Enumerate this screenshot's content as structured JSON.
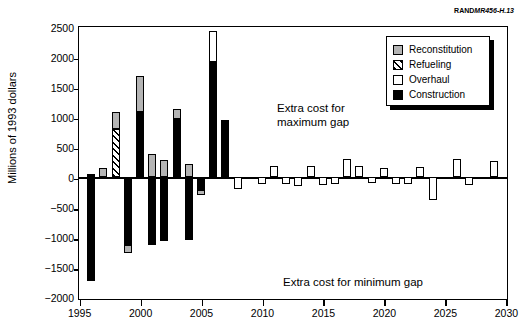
{
  "caption": {
    "rand": "RAND",
    "doc": "MR456-H.13"
  },
  "annotations": {
    "max_line1": "Extra cost for",
    "max_line2": "maximum gap",
    "min": "Extra cost for minimum gap"
  },
  "legend": {
    "items": [
      {
        "key": "reconstitution",
        "label": "Reconstitution",
        "color": "#b4b4b4"
      },
      {
        "key": "refueling",
        "label": "Refueling",
        "color": "#000000"
      },
      {
        "key": "overhaul",
        "label": "Overhaul",
        "color": "#ffffff"
      },
      {
        "key": "construction",
        "label": "Construction",
        "color": "#000000"
      }
    ]
  },
  "chart_data": {
    "type": "bar",
    "title": "",
    "subtitle": "",
    "xlabel": "",
    "ylabel": "Millions of 1993 dollars",
    "xlim": [
      1995,
      2030
    ],
    "ylim": [
      -2000,
      2500
    ],
    "ytick_labels": [
      "2500",
      "2000",
      "1500",
      "1000",
      "500",
      "0",
      "-500",
      "-1000",
      "-1500",
      "-2000"
    ],
    "yticks": [
      2500,
      2000,
      1500,
      1000,
      500,
      0,
      -500,
      -1000,
      -1500,
      -2000
    ],
    "xtick_labels": [
      "1995",
      "2000",
      "2005",
      "2010",
      "2015",
      "2020",
      "2025",
      "2030"
    ],
    "xticks": [
      1995,
      2000,
      2005,
      2010,
      2015,
      2020,
      2025,
      2030
    ],
    "grid": false,
    "legend_position": "top-right",
    "stacked": true,
    "series": [
      {
        "name": "Construction",
        "key": "construction"
      },
      {
        "name": "Refueling",
        "key": "refueling"
      },
      {
        "name": "Overhaul",
        "key": "overhaul"
      },
      {
        "name": "Reconstitution",
        "key": "reconstitution"
      }
    ],
    "x": [
      1996,
      1997,
      1998,
      1999,
      2000,
      2001,
      2002,
      2003,
      2004,
      2005,
      2006,
      2007,
      2008,
      2009,
      2010,
      2011,
      2012,
      2013,
      2014,
      2015,
      2016,
      2017,
      2018,
      2019,
      2020,
      2021,
      2022,
      2023,
      2024,
      2025,
      2026,
      2027,
      2028,
      2029,
      2030
    ],
    "bars": [
      {
        "year": 1996,
        "segments": [
          {
            "key": "construction",
            "from": 0,
            "to": -1720
          },
          {
            "key": "construction",
            "from": 0,
            "to": 60
          }
        ]
      },
      {
        "year": 1997,
        "segments": [
          {
            "key": "reconstitution",
            "from": 0,
            "to": 160
          }
        ]
      },
      {
        "year": 1998,
        "segments": [
          {
            "key": "refueling",
            "from": 0,
            "to": 800
          },
          {
            "key": "reconstitution",
            "from": 800,
            "to": 1080
          }
        ]
      },
      {
        "year": 1999,
        "segments": [
          {
            "key": "construction",
            "from": -1120,
            "to": 0
          },
          {
            "key": "reconstitution",
            "from": -1250,
            "to": -1120
          }
        ]
      },
      {
        "year": 2000,
        "segments": [
          {
            "key": "construction",
            "from": 0,
            "to": 1095
          },
          {
            "key": "reconstitution",
            "from": 1095,
            "to": 1690
          }
        ]
      },
      {
        "year": 2001,
        "segments": [
          {
            "key": "reconstitution",
            "from": 0,
            "to": 385
          },
          {
            "key": "construction",
            "from": -1130,
            "to": 0
          }
        ]
      },
      {
        "year": 2002,
        "segments": [
          {
            "key": "reconstitution",
            "from": 0,
            "to": 290
          },
          {
            "key": "construction",
            "from": -1050,
            "to": 0
          }
        ]
      },
      {
        "year": 2003,
        "segments": [
          {
            "key": "construction",
            "from": 0,
            "to": 975
          },
          {
            "key": "reconstitution",
            "from": 975,
            "to": 1145
          }
        ]
      },
      {
        "year": 2004,
        "segments": [
          {
            "key": "reconstitution",
            "from": 0,
            "to": 225
          },
          {
            "key": "construction",
            "from": -1040,
            "to": 0
          }
        ]
      },
      {
        "year": 2005,
        "segments": [
          {
            "key": "construction",
            "from": -205,
            "to": 0
          },
          {
            "key": "reconstitution",
            "from": -290,
            "to": -205
          }
        ]
      },
      {
        "year": 2006,
        "segments": [
          {
            "key": "construction",
            "from": 0,
            "to": 1920
          },
          {
            "key": "overhaul",
            "from": 1920,
            "to": 2440
          }
        ]
      },
      {
        "year": 2007,
        "segments": [
          {
            "key": "construction",
            "from": 0,
            "to": 960
          }
        ]
      },
      {
        "year": 2008,
        "segments": [
          {
            "key": "overhaul",
            "from": -195,
            "to": 0
          }
        ]
      },
      {
        "year": 2010,
        "segments": [
          {
            "key": "overhaul",
            "from": -110,
            "to": 0
          }
        ]
      },
      {
        "year": 2011,
        "segments": [
          {
            "key": "overhaul",
            "from": 0,
            "to": 185
          }
        ]
      },
      {
        "year": 2012,
        "segments": [
          {
            "key": "overhaul",
            "from": -110,
            "to": 0
          }
        ]
      },
      {
        "year": 2013,
        "segments": [
          {
            "key": "overhaul",
            "from": -140,
            "to": 0
          }
        ]
      },
      {
        "year": 2014,
        "segments": [
          {
            "key": "overhaul",
            "from": 0,
            "to": 195
          }
        ]
      },
      {
        "year": 2015,
        "segments": [
          {
            "key": "overhaul",
            "from": -125,
            "to": 0
          }
        ]
      },
      {
        "year": 2016,
        "segments": [
          {
            "key": "overhaul",
            "from": -105,
            "to": 0
          }
        ]
      },
      {
        "year": 2017,
        "segments": [
          {
            "key": "overhaul",
            "from": 0,
            "to": 300
          }
        ]
      },
      {
        "year": 2018,
        "segments": [
          {
            "key": "overhaul",
            "from": 0,
            "to": 185
          }
        ]
      },
      {
        "year": 2019,
        "segments": [
          {
            "key": "overhaul",
            "from": -100,
            "to": 0
          }
        ]
      },
      {
        "year": 2020,
        "segments": [
          {
            "key": "overhaul",
            "from": 0,
            "to": 165
          }
        ]
      },
      {
        "year": 2021,
        "segments": [
          {
            "key": "overhaul",
            "from": -110,
            "to": 0
          }
        ]
      },
      {
        "year": 2022,
        "segments": [
          {
            "key": "overhaul",
            "from": -110,
            "to": 0
          }
        ]
      },
      {
        "year": 2023,
        "segments": [
          {
            "key": "overhaul",
            "from": 0,
            "to": 170
          }
        ]
      },
      {
        "year": 2024,
        "segments": [
          {
            "key": "overhaul",
            "from": -380,
            "to": 0
          }
        ]
      },
      {
        "year": 2026,
        "segments": [
          {
            "key": "overhaul",
            "from": 0,
            "to": 310
          }
        ]
      },
      {
        "year": 2027,
        "segments": [
          {
            "key": "overhaul",
            "from": -125,
            "to": 0
          }
        ]
      },
      {
        "year": 2029,
        "segments": [
          {
            "key": "overhaul",
            "from": 0,
            "to": 270
          }
        ]
      }
    ]
  }
}
